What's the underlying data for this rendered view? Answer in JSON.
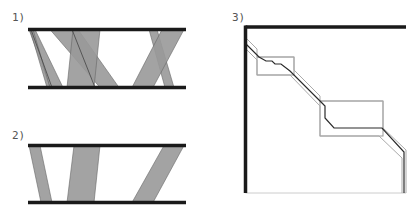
{
  "colors": {
    "bar": "#1a1a1a",
    "band_fill": "#999999",
    "band_stroke": "#666666",
    "path_dark": "#2a2a2a",
    "path_light": "#aaaaaa",
    "box_stroke": "#999999",
    "border_light": "#cccccc"
  },
  "panels": [
    {
      "label": "1)",
      "label_pos": [
        12,
        12
      ],
      "top_bar": {
        "x1": 28,
        "x2": 186,
        "y": 29.5
      },
      "bottom_bar": {
        "x1": 28,
        "x2": 186,
        "y": 87.5
      },
      "bands": [
        {
          "top": [
            29,
            35
          ],
          "bottom": [
            50,
            63
          ]
        },
        {
          "top": [
            30,
            33
          ],
          "bottom": [
            47,
            50
          ]
        },
        {
          "top": [
            50,
            78
          ],
          "bottom": [
            100,
            119
          ]
        },
        {
          "top": [
            73,
            100
          ],
          "bottom": [
            67,
            94
          ]
        },
        {
          "top": [
            149,
            157
          ],
          "bottom": [
            165,
            174
          ]
        },
        {
          "top": [
            162,
            184
          ],
          "bottom": [
            132,
            153
          ]
        }
      ],
      "lines": [
        {
          "top": 72,
          "bottom": 95
        },
        {
          "top": 31,
          "bottom": 52
        }
      ]
    },
    {
      "label": "2)",
      "label_pos": [
        12,
        130
      ],
      "top_bar": {
        "x1": 28,
        "x2": 186,
        "y": 145.5
      },
      "bottom_bar": {
        "x1": 28,
        "x2": 186,
        "y": 202.5
      },
      "bands": [
        {
          "top": [
            29,
            40
          ],
          "bottom": [
            41,
            52
          ]
        },
        {
          "top": [
            74,
            100
          ],
          "bottom": [
            67,
            94
          ]
        },
        {
          "top": [
            164,
            184
          ],
          "bottom": [
            132,
            153
          ]
        }
      ]
    },
    {
      "label": "3)",
      "label_pos": [
        232,
        12
      ],
      "frame": {
        "x1": 245.5,
        "y1": 28.5,
        "x2": 406,
        "y2": 193
      },
      "boxes": [
        {
          "x": 257,
          "y": 57,
          "w": 37,
          "h": 18
        },
        {
          "x": 320,
          "y": 101,
          "w": 63,
          "h": 35
        }
      ],
      "alignment_path_center": [
        [
          246,
          44
        ],
        [
          259,
          57
        ],
        [
          266,
          61
        ],
        [
          272,
          61
        ],
        [
          275,
          64
        ],
        [
          281,
          64
        ],
        [
          290,
          71
        ],
        [
          322,
          103
        ],
        [
          325,
          106
        ],
        [
          325,
          118
        ],
        [
          334,
          128
        ],
        [
          382,
          128
        ],
        [
          404,
          152
        ],
        [
          404,
          193
        ]
      ],
      "band_upper": [
        [
          246,
          38
        ],
        [
          257,
          49
        ],
        [
          257,
          57
        ],
        [
          294,
          57
        ],
        [
          294,
          70
        ],
        [
          320,
          96
        ],
        [
          320,
          101
        ],
        [
          383,
          101
        ],
        [
          383,
          128
        ],
        [
          406,
          150
        ]
      ],
      "band_lower": [
        [
          246,
          49
        ],
        [
          257,
          60
        ],
        [
          257,
          75
        ],
        [
          290,
          75
        ],
        [
          320,
          106
        ],
        [
          320,
          136
        ],
        [
          379,
          136
        ],
        [
          402,
          158
        ],
        [
          402,
          193
        ]
      ],
      "right_tail": [
        [
          406,
          150
        ],
        [
          406,
          193
        ]
      ]
    }
  ]
}
